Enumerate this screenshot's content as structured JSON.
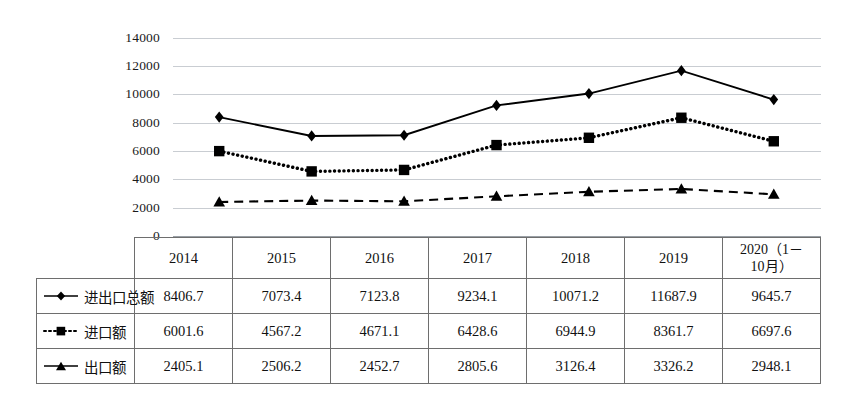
{
  "chart_data": {
    "type": "line",
    "title": "",
    "xlabel": "",
    "ylabel": "",
    "ylim": [
      0,
      14000
    ],
    "yticks": [
      "0",
      "2000",
      "4000",
      "6000",
      "8000",
      "10000",
      "12000",
      "14000"
    ],
    "grid": true,
    "legend_position": "table-left-column",
    "categories": [
      "2014",
      "2015",
      "2016",
      "2017",
      "2018",
      "2019",
      "2020（1－10月）"
    ],
    "series": [
      {
        "name": "进出口总额",
        "marker": "diamond",
        "line_style": "solid",
        "color": "#000000",
        "values": [
          8406.7,
          7073.4,
          7123.8,
          9234.1,
          10071.2,
          11687.9,
          9645.7
        ]
      },
      {
        "name": "进口额",
        "marker": "square",
        "line_style": "dotted",
        "color": "#000000",
        "values": [
          6001.6,
          4567.2,
          4671.1,
          6428.6,
          6944.9,
          8361.7,
          6697.6
        ]
      },
      {
        "name": "出口额",
        "marker": "triangle",
        "line_style": "dashed",
        "color": "#000000",
        "values": [
          2405.1,
          2506.2,
          2452.7,
          2805.6,
          3126.4,
          3326.2,
          2948.1
        ]
      }
    ]
  },
  "table": {
    "header_row": [
      "",
      "2014",
      "2015",
      "2016",
      "2017",
      "2018",
      "2019",
      "2020（1－10月）"
    ],
    "header_last_line1": "2020（1－",
    "header_last_line2": "10月）",
    "rows": [
      {
        "label": "进出口总额",
        "marker": "diamond",
        "line_style": "solid",
        "cells": [
          "8406.7",
          "7073.4",
          "7123.8",
          "9234.1",
          "10071.2",
          "11687.9",
          "9645.7"
        ]
      },
      {
        "label": "进口额",
        "marker": "square",
        "line_style": "dotted",
        "cells": [
          "6001.6",
          "4567.2",
          "4671.1",
          "6428.6",
          "6944.9",
          "8361.7",
          "6697.6"
        ]
      },
      {
        "label": "出口额",
        "marker": "triangle",
        "line_style": "dashed",
        "cells": [
          "2405.1",
          "2506.2",
          "2452.7",
          "2805.6",
          "3126.4",
          "3326.2",
          "2948.1"
        ]
      }
    ]
  },
  "colors": {
    "ink": "#000000",
    "gridline": "#c9cdd2",
    "table_border": "#6e6e6e",
    "background": "#ffffff"
  }
}
